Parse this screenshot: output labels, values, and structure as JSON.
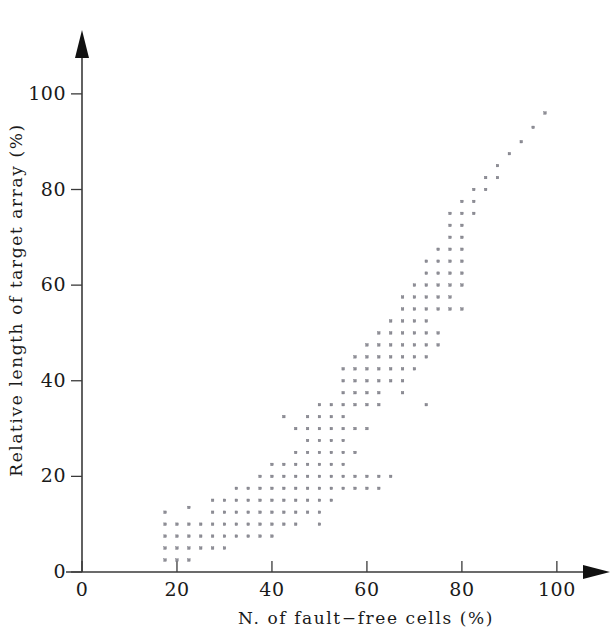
{
  "chart_data": {
    "type": "scatter",
    "title": "",
    "xlabel": "N. of fault−free cells (%)",
    "ylabel": "Relative length of target array (%)",
    "xlim": [
      0,
      110
    ],
    "ylim": [
      0,
      108
    ],
    "xticks": [
      0,
      20,
      40,
      60,
      80,
      100
    ],
    "yticks": [
      0,
      20,
      40,
      60,
      80,
      100
    ],
    "xtick_labels": [
      "0",
      "20",
      "40",
      "60",
      "80",
      "100"
    ],
    "ytick_labels": [
      "0",
      "20",
      "40",
      "60",
      "80",
      "100"
    ],
    "grid": false,
    "legend": null,
    "marker": "square",
    "marker_color": "#8e8e96",
    "axis_color": "#3a3a3a",
    "axes_style": "arrow-terminated open axes",
    "points": [
      [
        17.5,
        12.5
      ],
      [
        17.5,
        10.0
      ],
      [
        17.5,
        7.5
      ],
      [
        17.5,
        5.0
      ],
      [
        17.5,
        2.5
      ],
      [
        20.0,
        10.0
      ],
      [
        20.0,
        7.5
      ],
      [
        20.0,
        5.0
      ],
      [
        20.0,
        2.5
      ],
      [
        22.5,
        13.5
      ],
      [
        22.5,
        10.0
      ],
      [
        22.5,
        7.5
      ],
      [
        22.5,
        5.0
      ],
      [
        22.5,
        2.5
      ],
      [
        25.0,
        10.0
      ],
      [
        25.0,
        7.5
      ],
      [
        25.0,
        5.0
      ],
      [
        27.5,
        15.0
      ],
      [
        27.5,
        12.5
      ],
      [
        27.5,
        10.0
      ],
      [
        27.5,
        7.5
      ],
      [
        27.5,
        5.0
      ],
      [
        30.0,
        15.0
      ],
      [
        30.0,
        12.5
      ],
      [
        30.0,
        10.0
      ],
      [
        30.0,
        7.5
      ],
      [
        30.0,
        5.0
      ],
      [
        32.5,
        17.5
      ],
      [
        32.5,
        15.0
      ],
      [
        32.5,
        12.5
      ],
      [
        32.5,
        10.0
      ],
      [
        32.5,
        7.5
      ],
      [
        35.0,
        17.5
      ],
      [
        35.0,
        15.0
      ],
      [
        35.0,
        12.5
      ],
      [
        35.0,
        10.0
      ],
      [
        35.0,
        7.5
      ],
      [
        37.5,
        20.0
      ],
      [
        37.5,
        17.5
      ],
      [
        37.5,
        15.0
      ],
      [
        37.5,
        12.5
      ],
      [
        37.5,
        10.0
      ],
      [
        37.5,
        7.5
      ],
      [
        40.0,
        22.5
      ],
      [
        40.0,
        20.0
      ],
      [
        40.0,
        17.5
      ],
      [
        40.0,
        15.0
      ],
      [
        40.0,
        12.5
      ],
      [
        40.0,
        10.0
      ],
      [
        40.0,
        7.5
      ],
      [
        42.5,
        32.5
      ],
      [
        42.5,
        22.5
      ],
      [
        42.5,
        20.0
      ],
      [
        42.5,
        17.5
      ],
      [
        42.5,
        15.0
      ],
      [
        42.5,
        12.5
      ],
      [
        42.5,
        10.0
      ],
      [
        45.0,
        30.0
      ],
      [
        45.0,
        25.0
      ],
      [
        45.0,
        22.5
      ],
      [
        45.0,
        20.0
      ],
      [
        45.0,
        17.5
      ],
      [
        45.0,
        15.0
      ],
      [
        45.0,
        12.5
      ],
      [
        45.0,
        10.0
      ],
      [
        47.5,
        32.5
      ],
      [
        47.5,
        30.0
      ],
      [
        47.5,
        27.5
      ],
      [
        47.5,
        25.0
      ],
      [
        47.5,
        22.5
      ],
      [
        47.5,
        20.0
      ],
      [
        47.5,
        17.5
      ],
      [
        47.5,
        15.0
      ],
      [
        47.5,
        12.5
      ],
      [
        50.0,
        35.0
      ],
      [
        50.0,
        32.5
      ],
      [
        50.0,
        30.0
      ],
      [
        50.0,
        27.5
      ],
      [
        50.0,
        25.0
      ],
      [
        50.0,
        22.5
      ],
      [
        50.0,
        20.0
      ],
      [
        50.0,
        17.5
      ],
      [
        50.0,
        15.0
      ],
      [
        50.0,
        12.5
      ],
      [
        50.0,
        10.0
      ],
      [
        52.5,
        35.0
      ],
      [
        52.5,
        32.5
      ],
      [
        52.5,
        30.0
      ],
      [
        52.5,
        27.5
      ],
      [
        52.5,
        25.0
      ],
      [
        52.5,
        22.5
      ],
      [
        52.5,
        20.0
      ],
      [
        52.5,
        17.5
      ],
      [
        52.5,
        15.0
      ],
      [
        55.0,
        42.5
      ],
      [
        55.0,
        40.0
      ],
      [
        55.0,
        37.5
      ],
      [
        55.0,
        35.0
      ],
      [
        55.0,
        32.5
      ],
      [
        55.0,
        30.0
      ],
      [
        55.0,
        27.5
      ],
      [
        55.0,
        25.0
      ],
      [
        55.0,
        22.5
      ],
      [
        55.0,
        20.0
      ],
      [
        55.0,
        17.5
      ],
      [
        57.5,
        45.0
      ],
      [
        57.5,
        42.5
      ],
      [
        57.5,
        40.0
      ],
      [
        57.5,
        37.5
      ],
      [
        57.5,
        35.0
      ],
      [
        57.5,
        30.0
      ],
      [
        57.5,
        25.0
      ],
      [
        57.5,
        20.0
      ],
      [
        57.5,
        17.5
      ],
      [
        60.0,
        47.5
      ],
      [
        60.0,
        45.0
      ],
      [
        60.0,
        42.5
      ],
      [
        60.0,
        40.0
      ],
      [
        60.0,
        37.5
      ],
      [
        60.0,
        35.0
      ],
      [
        60.0,
        30.0
      ],
      [
        60.0,
        20.0
      ],
      [
        60.0,
        17.5
      ],
      [
        62.5,
        50.0
      ],
      [
        62.5,
        47.5
      ],
      [
        62.5,
        45.0
      ],
      [
        62.5,
        42.5
      ],
      [
        62.5,
        40.0
      ],
      [
        62.5,
        37.5
      ],
      [
        62.5,
        35.0
      ],
      [
        62.5,
        20.0
      ],
      [
        62.5,
        17.5
      ],
      [
        65.0,
        52.5
      ],
      [
        65.0,
        50.0
      ],
      [
        65.0,
        47.5
      ],
      [
        65.0,
        45.0
      ],
      [
        65.0,
        42.5
      ],
      [
        65.0,
        40.0
      ],
      [
        65.0,
        20.0
      ],
      [
        67.5,
        57.5
      ],
      [
        67.5,
        55.0
      ],
      [
        67.5,
        52.5
      ],
      [
        67.5,
        50.0
      ],
      [
        67.5,
        47.5
      ],
      [
        67.5,
        45.0
      ],
      [
        67.5,
        42.5
      ],
      [
        67.5,
        40.0
      ],
      [
        67.5,
        37.5
      ],
      [
        70.0,
        60.0
      ],
      [
        70.0,
        57.5
      ],
      [
        70.0,
        55.0
      ],
      [
        70.0,
        52.5
      ],
      [
        70.0,
        50.0
      ],
      [
        70.0,
        47.5
      ],
      [
        70.0,
        45.0
      ],
      [
        70.0,
        42.5
      ],
      [
        72.5,
        65.0
      ],
      [
        72.5,
        62.5
      ],
      [
        72.5,
        60.0
      ],
      [
        72.5,
        57.5
      ],
      [
        72.5,
        55.0
      ],
      [
        72.5,
        52.5
      ],
      [
        72.5,
        50.0
      ],
      [
        72.5,
        47.5
      ],
      [
        72.5,
        45.0
      ],
      [
        72.5,
        35.0
      ],
      [
        75.0,
        67.5
      ],
      [
        75.0,
        65.0
      ],
      [
        75.0,
        62.5
      ],
      [
        75.0,
        60.0
      ],
      [
        75.0,
        57.5
      ],
      [
        75.0,
        55.0
      ],
      [
        75.0,
        50.0
      ],
      [
        75.0,
        47.5
      ],
      [
        77.5,
        75.0
      ],
      [
        77.5,
        72.5
      ],
      [
        77.5,
        70.0
      ],
      [
        77.5,
        67.5
      ],
      [
        77.5,
        65.0
      ],
      [
        77.5,
        62.5
      ],
      [
        77.5,
        60.0
      ],
      [
        77.5,
        57.5
      ],
      [
        77.5,
        55.0
      ],
      [
        80.0,
        77.5
      ],
      [
        80.0,
        75.0
      ],
      [
        80.0,
        72.5
      ],
      [
        80.0,
        70.0
      ],
      [
        80.0,
        67.5
      ],
      [
        80.0,
        65.0
      ],
      [
        80.0,
        62.5
      ],
      [
        80.0,
        60.0
      ],
      [
        80.0,
        55.0
      ],
      [
        82.5,
        80.0
      ],
      [
        82.5,
        77.5
      ],
      [
        82.5,
        75.0
      ],
      [
        85.0,
        82.5
      ],
      [
        85.0,
        80.0
      ],
      [
        87.5,
        85.0
      ],
      [
        87.5,
        82.5
      ],
      [
        90.0,
        87.5
      ],
      [
        92.5,
        90.0
      ],
      [
        95.0,
        93.0
      ],
      [
        97.5,
        96.0
      ]
    ]
  },
  "axes": {
    "x_axis_name": "x-axis",
    "y_axis_name": "y-axis"
  }
}
